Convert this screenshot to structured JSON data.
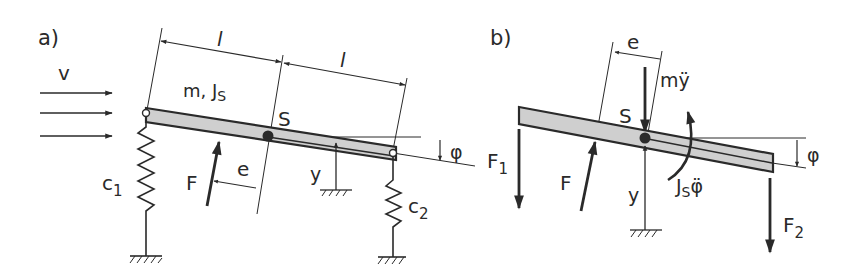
{
  "figure": {
    "panel_a": {
      "label": "a)",
      "velocity_label": "v",
      "mass_label": "m, J",
      "mass_label_sub": "S",
      "centroid_label": "S",
      "length_label_left": "l",
      "length_label_right": "l",
      "force_label": "F",
      "eccentricity_label": "e",
      "displacement_label": "y",
      "angle_label": "φ",
      "spring_left_label": "c",
      "spring_left_sub": "1",
      "spring_right_label": "c",
      "spring_right_sub": "2"
    },
    "panel_b": {
      "label": "b)",
      "eccentricity_label": "e",
      "inertia_force_label": "mÿ",
      "centroid_label": "S",
      "force_left_label": "F",
      "force_left_sub": "1",
      "force_label": "F",
      "displacement_label": "y",
      "inertia_moment_label": "J",
      "inertia_moment_sub": "S",
      "inertia_moment_suffix": "φ̈",
      "angle_label": "φ",
      "force_right_label": "F",
      "force_right_sub": "2"
    },
    "colors": {
      "ink": "#2a2a2a",
      "beam_fill": "#cfcfcf",
      "background": "#ffffff"
    }
  }
}
